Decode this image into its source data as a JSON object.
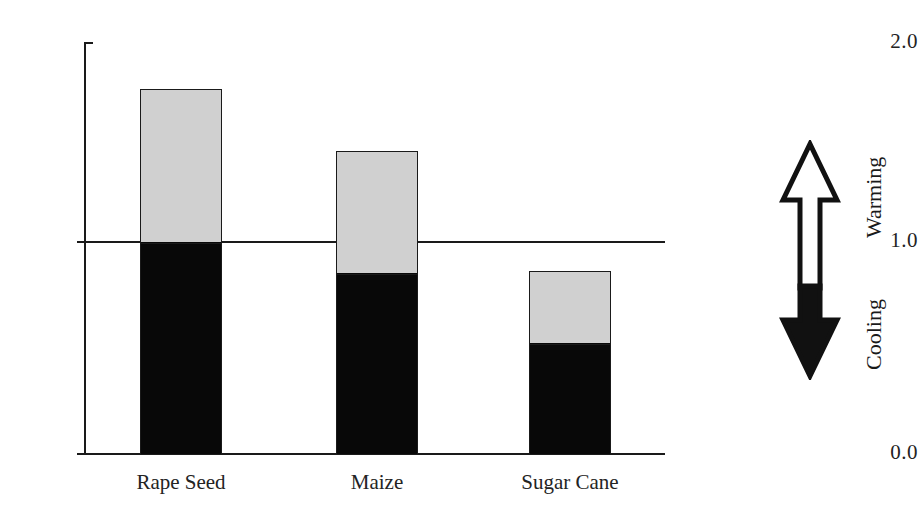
{
  "chart_data": {
    "type": "bar",
    "subtype": "stacked",
    "title": "",
    "xlabel": "",
    "ylabel": "",
    "ylim": [
      0.0,
      2.0
    ],
    "yticks": [
      0.0,
      1.0,
      2.0
    ],
    "ytick_labels": [
      "0.0",
      "1.0",
      "2.0"
    ],
    "grid": false,
    "reference_line": {
      "value": 1.0,
      "label": "1.0",
      "style": "solid"
    },
    "categories": [
      "Rape Seed",
      "Maize",
      "Sugar Cane"
    ],
    "series": [
      {
        "name": "lower-segment",
        "color": "#080808",
        "values": [
          1.03,
          0.88,
          0.54
        ]
      },
      {
        "name": "upper-segment",
        "color": "#d0d0d0",
        "values": [
          0.74,
          0.59,
          0.35
        ]
      }
    ],
    "totals": [
      1.77,
      1.47,
      0.89
    ],
    "legend": {
      "position": "right",
      "type": "double-headed-arrow",
      "entries": [
        {
          "label": "Warming",
          "direction": "up",
          "fill": "#ffffff"
        },
        {
          "label": "Cooling",
          "direction": "down",
          "fill": "#080808"
        }
      ]
    }
  },
  "axis": {
    "y": {
      "tick_top": "2.0",
      "tick_mid": "1.0",
      "tick_zero": "0.0"
    },
    "x": {
      "labels": [
        "Rape Seed",
        "Maize",
        "Sugar Cane"
      ]
    }
  },
  "legend": {
    "warming_label": "Warming",
    "cooling_label": "Cooling"
  },
  "colors": {
    "upper_segment": "#d0d0d0",
    "lower_segment": "#080808",
    "axis": "#1a1a1a",
    "background": "#ffffff"
  }
}
